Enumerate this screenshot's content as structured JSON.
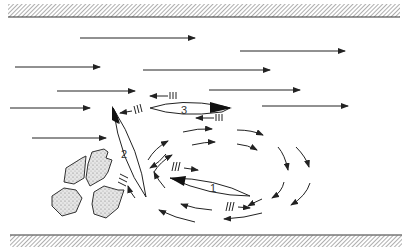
{
  "diagram": {
    "colors": {
      "ink": "#222222",
      "hatch": "#777777",
      "rock_fill": "#d8d8d8",
      "background": "#ffffff"
    },
    "banks": [
      {
        "name": "top-bank",
        "y": 14,
        "height": 12
      },
      {
        "name": "bottom-bank",
        "y": 233,
        "height": 12
      }
    ],
    "boats": [
      {
        "id": 1,
        "label": "1",
        "cx": 210,
        "cy": 186,
        "length": 82,
        "width": 16,
        "angle": 18,
        "bow": "left"
      },
      {
        "id": 2,
        "label": "2",
        "cx": 127,
        "cy": 153,
        "length": 96,
        "width": 18,
        "angle": 66,
        "bow": "top"
      },
      {
        "id": 3,
        "label": "3",
        "cx": 188,
        "cy": 108,
        "length": 78,
        "width": 14,
        "angle": 0,
        "bow": "right"
      }
    ],
    "current_arrows": [
      {
        "x1": 80,
        "y1": 38,
        "x2": 195,
        "y2": 38
      },
      {
        "x1": 240,
        "y1": 51,
        "x2": 345,
        "y2": 51
      },
      {
        "x1": 15,
        "y1": 67,
        "x2": 100,
        "y2": 67
      },
      {
        "x1": 143,
        "y1": 70,
        "x2": 270,
        "y2": 70
      },
      {
        "x1": 57,
        "y1": 91,
        "x2": 135,
        "y2": 91
      },
      {
        "x1": 209,
        "y1": 90,
        "x2": 300,
        "y2": 90
      },
      {
        "x1": 10,
        "y1": 108,
        "x2": 90,
        "y2": 108
      },
      {
        "x1": 262,
        "y1": 106,
        "x2": 348,
        "y2": 106
      },
      {
        "x1": 32,
        "y1": 138,
        "x2": 106,
        "y2": 138
      }
    ],
    "rocks": 4,
    "labels": [
      "1",
      "2",
      "3"
    ]
  }
}
